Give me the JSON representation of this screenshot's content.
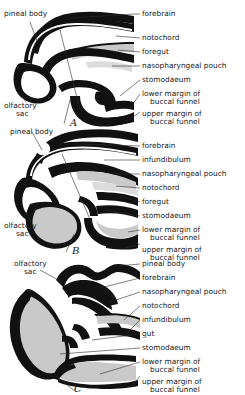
{
  "figure": {
    "panels": [
      {
        "letter": "A",
        "labels_right": [
          {
            "id": "forebrain",
            "text": "forebrain"
          },
          {
            "id": "notochord",
            "text": "notochord"
          },
          {
            "id": "foregut",
            "text": "foregut"
          },
          {
            "id": "nasopharyngeal-pouch",
            "text": "nasopharyngeal pouch"
          },
          {
            "id": "stomodaeum",
            "text": "stomodaeum"
          },
          {
            "id": "lower-margin-of-buccal-funnel",
            "text": "lower margin of",
            "text2": "buccal funnel"
          },
          {
            "id": "upper-margin-of-buccal-funnel",
            "text": "upper margin of",
            "text2": "buccal funnel"
          }
        ],
        "labels_left": [
          {
            "id": "pineal-body",
            "text": "pineal body"
          },
          {
            "id": "olfactory-sac",
            "text": "olfactory",
            "text2": "sac"
          }
        ]
      },
      {
        "letter": "B",
        "labels_right": [
          {
            "id": "forebrain",
            "text": "forebrain"
          },
          {
            "id": "infundibulum",
            "text": "infundibulum"
          },
          {
            "id": "nasopharyngeal-pouch",
            "text": "nasopharyngeal pouch"
          },
          {
            "id": "notochord",
            "text": "notochord"
          },
          {
            "id": "foregut",
            "text": "foregut"
          },
          {
            "id": "stomodaeum",
            "text": "stomodaeum"
          },
          {
            "id": "lower-margin-of-buccal-funnel",
            "text": "lower margin of",
            "text2": "buccal funnel"
          },
          {
            "id": "upper-margin-of-buccal-funnel",
            "text": "upper margin of",
            "text2": "buccal funnel"
          }
        ],
        "labels_left": [
          {
            "id": "pineal-body",
            "text": "pineal body"
          },
          {
            "id": "olfactory-sac",
            "text": "olfactory",
            "text2": "sac"
          }
        ]
      },
      {
        "letter": "C",
        "labels_right": [
          {
            "id": "pineal-body",
            "text": "pineal body"
          },
          {
            "id": "forebrain",
            "text": "forebrain"
          },
          {
            "id": "nasopharyngeal-pouch",
            "text": "nasopharyngeal pouch"
          },
          {
            "id": "notochord",
            "text": "notochord"
          },
          {
            "id": "infundibulum",
            "text": "infundibulum"
          },
          {
            "id": "gut",
            "text": "gut"
          },
          {
            "id": "stomodaeum",
            "text": "stomodaeum"
          },
          {
            "id": "lower-margin-of-buccal-funnel",
            "text": "lower margin of",
            "text2": "buccal funnel"
          },
          {
            "id": "upper-margin-of-buccal-funnel",
            "text": "upper margin of",
            "text2": "buccal funnel"
          }
        ],
        "labels_left": [
          {
            "id": "olfactory-sac",
            "text": "olfactory",
            "text2": "sac"
          }
        ]
      }
    ],
    "colors": {
      "ink": "#111111",
      "leader": "#2b2b2b",
      "stipple_medium": "#c9c9c9",
      "stipple_light": "#dcdcdc",
      "background": "#ffffff"
    }
  }
}
